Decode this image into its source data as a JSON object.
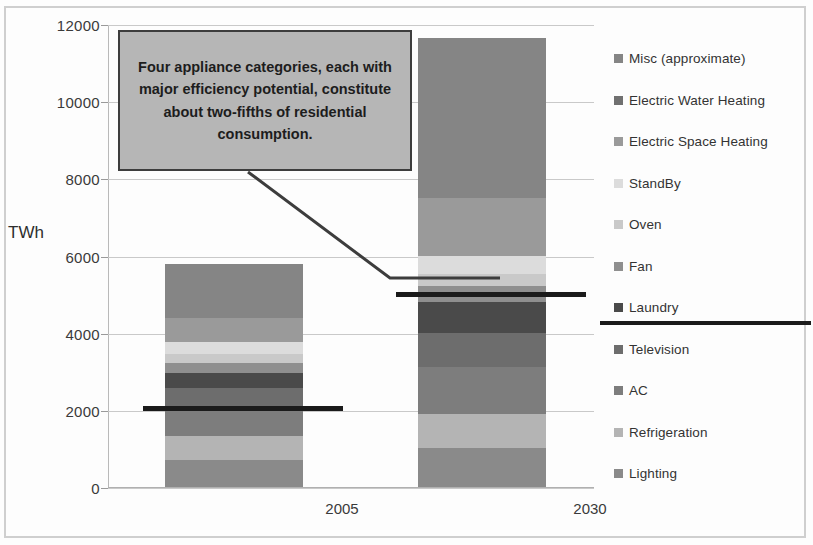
{
  "chart_data": {
    "type": "bar",
    "subtype": "stacked-bar",
    "title": "",
    "xlabel": "",
    "ylabel": "TWh",
    "ylim": [
      0,
      12000
    ],
    "yticks": [
      0,
      2000,
      4000,
      6000,
      8000,
      10000,
      12000
    ],
    "ytick_labels": [
      "0",
      "2000",
      "4000",
      "6000",
      "8000",
      "10000",
      "12000"
    ],
    "grid": true,
    "legend_position": "right",
    "categories": [
      "2005",
      "2030"
    ],
    "series": [
      {
        "name": "Lighting",
        "values": [
          700,
          1000
        ],
        "color": "#8a8a8a"
      },
      {
        "name": "Refrigeration",
        "values": [
          620,
          900
        ],
        "color": "#b4b4b4"
      },
      {
        "name": "AC",
        "values": [
          730,
          1200
        ],
        "color": "#7d7d7d"
      },
      {
        "name": "Television",
        "values": [
          520,
          900
        ],
        "color": "#6d6d6d"
      },
      {
        "name": "Laundry",
        "values": [
          380,
          800
        ],
        "color": "#4a4a4a"
      },
      {
        "name": "Fan",
        "values": [
          260,
          400
        ],
        "color": "#8f8f8f"
      },
      {
        "name": "Oven",
        "values": [
          240,
          330
        ],
        "color": "#c9c9c9"
      },
      {
        "name": "StandBy",
        "values": [
          300,
          450
        ],
        "color": "#dcdcdc"
      },
      {
        "name": "Electric Space Heating",
        "values": [
          620,
          1500
        ],
        "color": "#9a9a9a"
      },
      {
        "name": "Misc (approximate)",
        "values": [
          1410,
          4170
        ],
        "color": "#858585"
      }
    ],
    "totals": [
      5800,
      11650
    ],
    "reference_lines": [
      {
        "category": "2005",
        "value": 2050
      },
      {
        "category": "2030",
        "value": 5000
      }
    ],
    "annotations": [
      {
        "text": "Four appliance categories, each with major efficiency potential, constitute about two-fifths of residential consumption.",
        "points_to": "2030 reference line at 5000 TWh"
      }
    ]
  },
  "legend": {
    "items": [
      {
        "label": "Misc (approximate)",
        "color": "#858585"
      },
      {
        "label": "Electric Water Heating",
        "color": "#707070"
      },
      {
        "label": "Electric Space Heating",
        "color": "#9a9a9a"
      },
      {
        "label": "StandBy",
        "color": "#dcdcdc"
      },
      {
        "label": "Oven",
        "color": "#c9c9c9"
      },
      {
        "label": "Fan",
        "color": "#8f8f8f"
      },
      {
        "label": "Laundry",
        "color": "#4a4a4a"
      },
      {
        "label": "Television",
        "color": "#6d6d6d"
      },
      {
        "label": "AC",
        "color": "#7d7d7d"
      },
      {
        "label": "Refrigeration",
        "color": "#b4b4b4"
      },
      {
        "label": "Lighting",
        "color": "#8a8a8a"
      }
    ]
  },
  "colors": {
    "reference_line": "#1b1b1b",
    "callout_fill": "#b6b6b6",
    "callout_border": "#3d3d3d",
    "gridline": "#c9c9c9",
    "text": "#333333"
  }
}
